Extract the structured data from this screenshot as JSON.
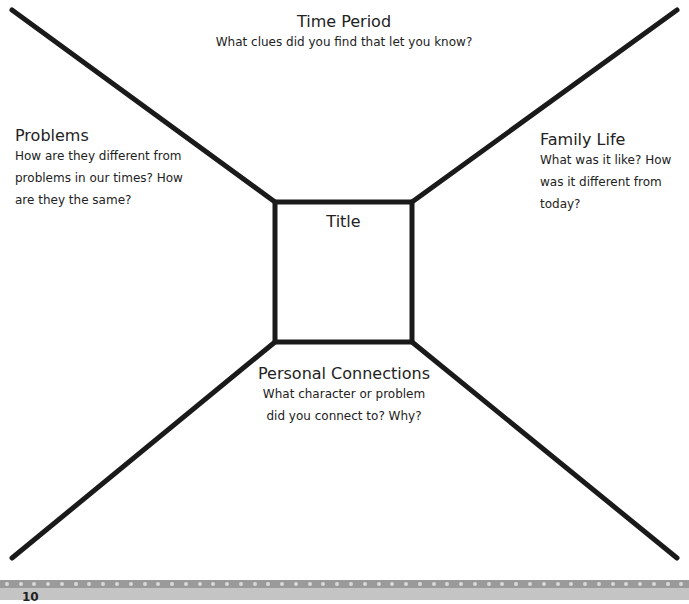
{
  "organizer": {
    "top": {
      "heading": "Time Period",
      "prompt": "What clues did you find that let you know?"
    },
    "left": {
      "heading": "Problems",
      "prompt_lines": [
        "How are they different from",
        "problems in our times? How",
        "are they the same?"
      ]
    },
    "right": {
      "heading": "Family Life",
      "prompt_lines": [
        "What was it like? How",
        "was it different from",
        "today?"
      ]
    },
    "center": {
      "heading": "Title"
    },
    "bottom": {
      "heading": "Personal Connections",
      "prompt_lines": [
        "What character or problem",
        "did you connect to? Why?"
      ]
    }
  },
  "footer": {
    "page_number": "10"
  },
  "colors": {
    "line": "#1a1a1a",
    "footer_strip": "#9a9a9a",
    "footer_band": "#c4c4c4"
  }
}
